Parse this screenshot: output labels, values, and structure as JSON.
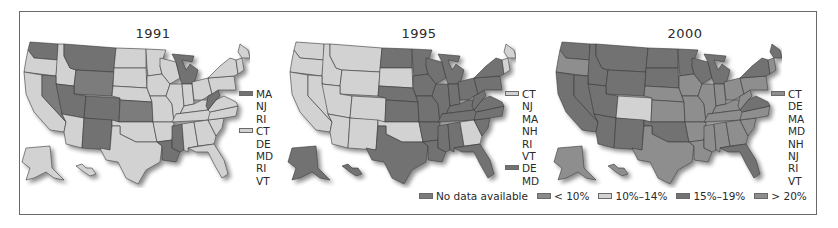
{
  "figure": {
    "panels": [
      {
        "title": "1991",
        "inset_legend": [
          {
            "label": "MA",
            "swatch": "15-19"
          },
          {
            "label": "NJ"
          },
          {
            "label": "RI"
          },
          {
            "label": "CT",
            "swatch": "10-14"
          },
          {
            "label": "DE"
          },
          {
            "label": "MD"
          },
          {
            "label": "RI"
          },
          {
            "label": "VT"
          }
        ]
      },
      {
        "title": "1995",
        "inset_legend": [
          {
            "label": "CT",
            "swatch": "10-14"
          },
          {
            "label": "NJ"
          },
          {
            "label": "MA"
          },
          {
            "label": "NH"
          },
          {
            "label": "RI"
          },
          {
            "label": "VT"
          },
          {
            "label": "DE",
            "swatch": "15-19"
          },
          {
            "label": "MD"
          }
        ]
      },
      {
        "title": "2000",
        "inset_legend": [
          {
            "label": "CT",
            "swatch": "gt20"
          },
          {
            "label": "DE"
          },
          {
            "label": "MA"
          },
          {
            "label": "MD"
          },
          {
            "label": "NH"
          },
          {
            "label": "NJ"
          },
          {
            "label": "RI"
          },
          {
            "label": "VT"
          }
        ]
      }
    ],
    "legend": [
      {
        "key": "nodata",
        "label": "No data available",
        "color": "#7b7b7b"
      },
      {
        "key": "lt10",
        "label": "< 10%",
        "color": "#8a8a8a"
      },
      {
        "key": "10-14",
        "label": "10%–14%",
        "color": "#d2d2d2"
      },
      {
        "key": "15-19",
        "label": "15%–19%",
        "color": "#727272"
      },
      {
        "key": "gt20",
        "label": "> 20%",
        "color": "#8e8e8e"
      }
    ]
  },
  "chart_data": {
    "type": "choropleth",
    "title": "",
    "panels": [
      "1991",
      "1995",
      "2000"
    ],
    "categories": [
      "No data available",
      "< 10%",
      "10%–14%",
      "15%–19%",
      "> 20%"
    ],
    "legend_position": "bottom-right",
    "states": {
      "1991": {
        "10%–14%": [
          "OR",
          "CA",
          "ID",
          "AZ",
          "ND",
          "SD",
          "NE",
          "MN",
          "IA",
          "MO",
          "OK",
          "TX",
          "AR",
          "WI",
          "IL",
          "IN",
          "OH",
          "KY",
          "TN",
          "AL",
          "GA",
          "FL",
          "SC",
          "NC",
          "VA",
          "PA",
          "NY",
          "ME",
          "NH",
          "AK",
          "HI",
          "CT",
          "DE",
          "MD",
          "RI",
          "VT"
        ],
        "15%–19%": [
          "WA",
          "MT",
          "UT",
          "CO",
          "NM",
          "MI",
          "WV",
          "LA",
          "MS",
          "MA",
          "NJ",
          "RI"
        ],
        "No data available": [
          "NV",
          "WY",
          "KS"
        ]
      },
      "1995": {
        "10%–14%": [
          "WA",
          "OR",
          "CA",
          "ID",
          "NV",
          "MT",
          "WY",
          "UT",
          "CO",
          "AZ",
          "NM",
          "SD",
          "OK",
          "GA",
          "ME",
          "VT",
          "NH",
          "CT",
          "NJ",
          "MA",
          "RI"
        ],
        "15%–19%": [
          "ND",
          "NE",
          "KS",
          "MN",
          "IA",
          "MO",
          "TX",
          "AR",
          "LA",
          "WI",
          "IL",
          "IN",
          "MI",
          "OH",
          "KY",
          "TN",
          "MS",
          "AL",
          "FL",
          "SC",
          "NC",
          "VA",
          "WV",
          "PA",
          "NY",
          "AK",
          "HI",
          "DE",
          "MD"
        ]
      },
      "2000": {
        "10%–14%": [
          "CO"
        ],
        "15%–19%": [
          "WA",
          "ID",
          "MT",
          "WY",
          "ND",
          "SD",
          "NE",
          "MN",
          "NV",
          "CA",
          "UT",
          "AZ",
          "NM",
          "OK",
          "WI",
          "MI",
          "NY",
          "FL",
          "VA"
        ],
        "> 20%": [
          "OR",
          "KS",
          "IA",
          "MO",
          "TX",
          "AR",
          "LA",
          "IL",
          "IN",
          "OH",
          "KY",
          "TN",
          "MS",
          "AL",
          "GA",
          "SC",
          "NC",
          "WV",
          "PA",
          "ME",
          "AK",
          "HI",
          "CT",
          "DE",
          "MA",
          "MD",
          "NH",
          "NJ",
          "RI",
          "VT"
        ]
      }
    }
  },
  "map_fills": {
    "1991": {
      "WA": "15-19",
      "OR": "10-14",
      "CA": "10-14",
      "ID": "10-14",
      "NV": "nodata",
      "MT": "15-19",
      "WY": "nodata",
      "UT": "15-19",
      "CO": "15-19",
      "AZ": "10-14",
      "NM": "15-19",
      "ND": "10-14",
      "SD": "10-14",
      "NE": "10-14",
      "KS": "nodata",
      "OK": "10-14",
      "TX": "10-14",
      "MN": "10-14",
      "IA": "10-14",
      "MO": "10-14",
      "AR": "10-14",
      "LA": "15-19",
      "WI": "10-14",
      "IL": "10-14",
      "MI": "15-19",
      "IN": "10-14",
      "OH": "10-14",
      "KY": "10-14",
      "TN": "10-14",
      "MS": "15-19",
      "AL": "10-14",
      "GA": "10-14",
      "FL": "10-14",
      "SC": "10-14",
      "NC": "10-14",
      "VA": "10-14",
      "WV": "15-19",
      "PA": "10-14",
      "NY": "10-14",
      "NE2": "10-14",
      "ME": "10-14",
      "AK": "10-14",
      "HI": "10-14"
    },
    "1995": {
      "WA": "10-14",
      "OR": "10-14",
      "CA": "10-14",
      "ID": "10-14",
      "NV": "10-14",
      "MT": "10-14",
      "WY": "10-14",
      "UT": "10-14",
      "CO": "10-14",
      "AZ": "10-14",
      "NM": "10-14",
      "ND": "15-19",
      "SD": "10-14",
      "NE": "15-19",
      "KS": "15-19",
      "OK": "10-14",
      "TX": "15-19",
      "MN": "15-19",
      "IA": "15-19",
      "MO": "15-19",
      "AR": "15-19",
      "LA": "15-19",
      "WI": "15-19",
      "IL": "15-19",
      "MI": "15-19",
      "IN": "15-19",
      "OH": "15-19",
      "KY": "15-19",
      "TN": "15-19",
      "MS": "15-19",
      "AL": "15-19",
      "GA": "10-14",
      "FL": "15-19",
      "SC": "15-19",
      "NC": "15-19",
      "VA": "15-19",
      "WV": "15-19",
      "PA": "15-19",
      "NY": "15-19",
      "NE2": "10-14",
      "ME": "10-14",
      "AK": "15-19",
      "HI": "15-19"
    },
    "2000": {
      "WA": "15-19",
      "OR": "gt20",
      "CA": "15-19",
      "ID": "15-19",
      "NV": "15-19",
      "MT": "15-19",
      "WY": "15-19",
      "UT": "15-19",
      "CO": "10-14",
      "AZ": "15-19",
      "NM": "15-19",
      "ND": "15-19",
      "SD": "15-19",
      "NE": "gt20",
      "KS": "gt20",
      "OK": "15-19",
      "TX": "gt20",
      "MN": "15-19",
      "IA": "gt20",
      "MO": "gt20",
      "AR": "gt20",
      "LA": "gt20",
      "WI": "15-19",
      "IL": "gt20",
      "MI": "15-19",
      "IN": "gt20",
      "OH": "gt20",
      "KY": "gt20",
      "TN": "gt20",
      "MS": "gt20",
      "AL": "gt20",
      "GA": "gt20",
      "FL": "15-19",
      "SC": "gt20",
      "NC": "gt20",
      "VA": "15-19",
      "WV": "gt20",
      "PA": "gt20",
      "NY": "15-19",
      "NE2": "gt20",
      "ME": "15-19",
      "AK": "gt20",
      "HI": "gt20"
    }
  }
}
